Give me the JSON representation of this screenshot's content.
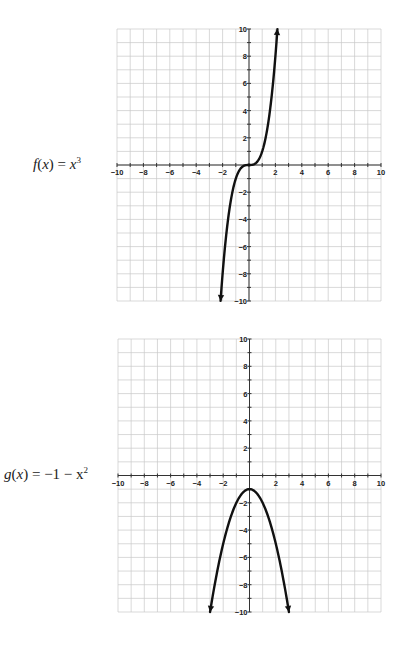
{
  "chart_data": [
    {
      "type": "line",
      "label": "f(x) = x³",
      "label_parts": {
        "name": "f",
        "var": "x",
        "rhs": "x",
        "exp": "3"
      },
      "function": "x^3",
      "xlim": [
        -10,
        10
      ],
      "ylim": [
        -10,
        10
      ],
      "grid": true,
      "xticks": [
        "-10",
        "-8",
        "-6",
        "-4",
        "-2",
        "2",
        "4",
        "6",
        "8",
        "10"
      ],
      "yticks": [
        "10",
        "8",
        "6",
        "4",
        "2",
        "-2",
        "-4",
        "-6",
        "-8",
        "-10"
      ],
      "x": [
        -2.154,
        -2,
        -1.5,
        -1,
        -0.5,
        0,
        0.5,
        1,
        1.5,
        2,
        2.154
      ],
      "y": [
        -10,
        -8,
        -3.375,
        -1,
        -0.125,
        0,
        0.125,
        1,
        3.375,
        8,
        10
      ],
      "arrows": "both-ends"
    },
    {
      "type": "line",
      "label": "g(x) = −1 − x²",
      "label_parts": {
        "name": "g",
        "var": "x",
        "rhs": "−1 − x",
        "exp": "2"
      },
      "function": "-1 - x^2",
      "xlim": [
        -10,
        10
      ],
      "ylim": [
        -10,
        10
      ],
      "grid": true,
      "xticks": [
        "-10",
        "-8",
        "-6",
        "-4",
        "-2",
        "2",
        "4",
        "6",
        "8",
        "10"
      ],
      "yticks": [
        "10",
        "8",
        "6",
        "4",
        "2",
        "-2",
        "-4",
        "-6",
        "-8",
        "-10"
      ],
      "x": [
        -3,
        -2,
        -1,
        0,
        1,
        2,
        3
      ],
      "y": [
        -10,
        -5,
        -2,
        -1,
        -2,
        -5,
        -10
      ],
      "arrows": "both-ends"
    }
  ]
}
